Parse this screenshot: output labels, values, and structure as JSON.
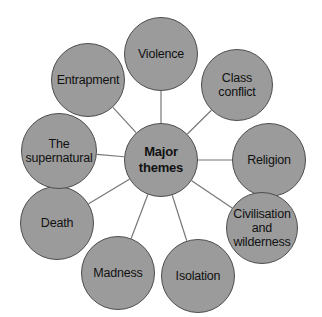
{
  "diagram": {
    "type": "mind-map",
    "title": "Major themes",
    "background_color": "#ffffff",
    "node_fill_color": "#9b9b9b",
    "node_stroke_color": "#4d4d4d",
    "connector_color": "#777777",
    "text_color": "#111111",
    "center": {
      "label": "Major\nthemes",
      "cx": 161,
      "cy": 160,
      "r": 37
    },
    "satellites": [
      {
        "name": "violence",
        "label": "Violence",
        "cx": 161,
        "cy": 54,
        "r": 37
      },
      {
        "name": "class-conflict",
        "label": "Class conflict",
        "cx": 237,
        "cy": 85,
        "r": 36
      },
      {
        "name": "religion",
        "label": "Religion",
        "cx": 269,
        "cy": 160,
        "r": 37
      },
      {
        "name": "civilisation",
        "label": "Civilisation\nand\nwilderness",
        "cx": 262,
        "cy": 228,
        "r": 36
      },
      {
        "name": "isolation",
        "label": "Isolation",
        "cx": 198,
        "cy": 276,
        "r": 37
      },
      {
        "name": "madness",
        "label": "Madness",
        "cx": 118,
        "cy": 273,
        "r": 37
      },
      {
        "name": "death",
        "label": "Death",
        "cx": 57,
        "cy": 223,
        "r": 37
      },
      {
        "name": "the-supernatural",
        "label": "The\nsupernatural",
        "cx": 59,
        "cy": 151,
        "r": 38
      },
      {
        "name": "entrapment",
        "label": "Entrapment",
        "cx": 88,
        "cy": 80,
        "r": 37
      }
    ]
  }
}
